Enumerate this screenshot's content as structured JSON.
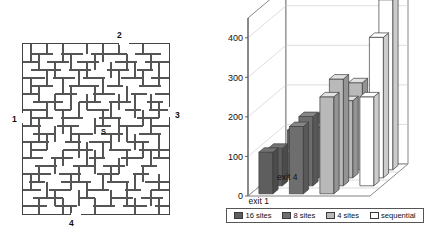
{
  "maze": {
    "name": "maze-diagram",
    "start_marker": "S",
    "exit_labels": [
      {
        "id": "1",
        "side": "left"
      },
      {
        "id": "2",
        "side": "top"
      },
      {
        "id": "3",
        "side": "right"
      },
      {
        "id": "4",
        "side": "bottom"
      }
    ]
  },
  "chart_data": {
    "type": "bar",
    "title": "seconds",
    "subtitle": "",
    "xlabel": "",
    "ylabel": "seconds",
    "ylim": [
      0,
      450
    ],
    "yticks": [
      0,
      100,
      200,
      300,
      400
    ],
    "grid": true,
    "legend_position": "bottom",
    "projection": "3d",
    "categories": [
      "exit 1",
      "exit 2",
      "exit 3",
      "exit 4"
    ],
    "visible_tick_labels": [
      "exit 1",
      "exit 4"
    ],
    "series": [
      {
        "name": "16 sites",
        "color": "#5e5e5e",
        "values": [
          105,
          95,
          62,
          100
        ]
      },
      {
        "name": "8 sites",
        "color": "#6e6e6e",
        "values": [
          170,
          175,
          128,
          142
        ]
      },
      {
        "name": "4 sites",
        "color": "#b9b9b9",
        "values": [
          245,
          270,
          195,
          220
        ]
      },
      {
        "name": "sequential",
        "color": "#ffffff",
        "values": [
          null,
          225,
          355,
          430
        ]
      }
    ]
  },
  "legend": {
    "entries": [
      {
        "label": "16 sites"
      },
      {
        "label": "8 sites"
      },
      {
        "label": "4 sites"
      },
      {
        "label": "sequential"
      }
    ]
  }
}
